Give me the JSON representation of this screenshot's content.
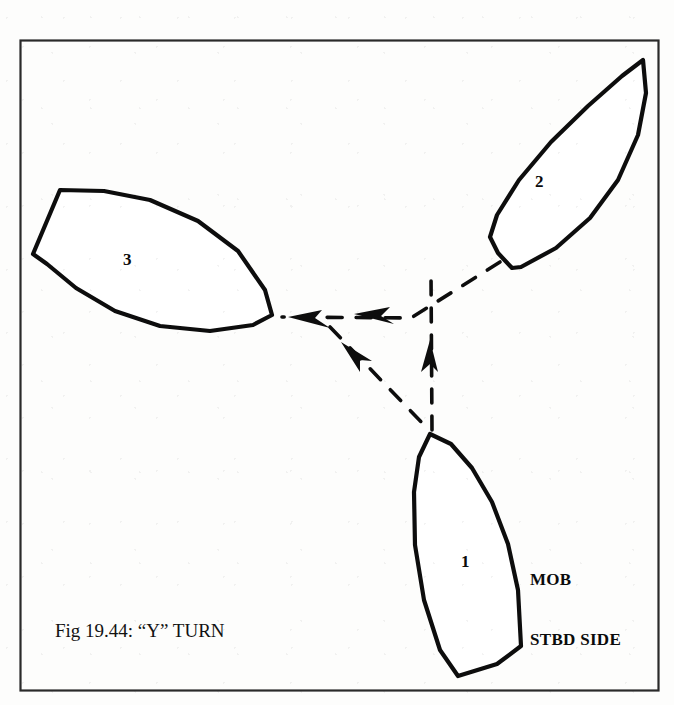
{
  "figure": {
    "caption": "Fig 19.44: “Y” TURN",
    "border_color": "#2a2a2a",
    "ink_color": "#0d0d0d",
    "background_color": "#fdfdfc",
    "frame": {
      "x": 20,
      "y": 40,
      "width": 638,
      "height": 650
    }
  },
  "annotations": {
    "mob_line1": "MOB",
    "mob_line2": "STBD SIDE"
  },
  "vessels": [
    {
      "label": "1",
      "name": "vessel-position-1",
      "description": "initial heading north, man overboard on starboard side",
      "label_x": 466,
      "label_y": 562,
      "outline": "M 430 434 L 451 444 L 472 468 L 492 502 L 508 544 L 518 590 L 521 646 L 497 664 L 458 676 L 440 650 L 424 600 L 415 545 L 414 492 L 419 457 Z"
    },
    {
      "label": "2",
      "name": "vessel-position-2",
      "description": "heading north-east after first leg of Y turn",
      "label_x": 540,
      "label_y": 182,
      "outline": "M 643 60 L 646 93 L 638 135 L 618 180 L 590 218 L 556 248 L 521 267 L 512 268 L 498 253 L 490 237 L 497 215 L 519 180 L 551 142 L 588 106 L 622 76 Z"
    },
    {
      "label": "3",
      "name": "vessel-position-3",
      "description": "final heading, returning toward man overboard",
      "label_x": 128,
      "label_y": 260,
      "outline": "M 60 190 L 104 191 L 150 200 L 198 221 L 238 251 L 265 290 L 272 315 L 253 325 L 210 331 L 160 326 L 115 311 L 76 288 L 47 264 L 33 254 Z"
    }
  ],
  "track": {
    "legs": [
      {
        "name": "leg-1-to-2",
        "from": "1",
        "to": "2",
        "direction": "north",
        "path": "M 432 430 L 431 274",
        "dash": "14 13"
      },
      {
        "name": "leg-2-to-3",
        "from": "2",
        "to": "3",
        "direction": "south-west then west",
        "path": "M 500 262 L 411 318 L 282 317",
        "dash": "15 14"
      },
      {
        "name": "leg-3-turn",
        "from": "3",
        "to": "1",
        "direction": "south-east",
        "path": "M 330 327 L 429 430",
        "dash": "15 14"
      }
    ],
    "arrowheads": [
      {
        "name": "arrow-west-outer",
        "x": 300,
        "y": 318,
        "angle": 186
      },
      {
        "name": "arrow-west-inner",
        "x": 366,
        "y": 314,
        "angle": 188
      },
      {
        "name": "arrow-north",
        "x": 430,
        "y": 344,
        "angle": 272
      },
      {
        "name": "arrow-south-east",
        "x": 352,
        "y": 348,
        "angle": 44
      }
    ]
  }
}
